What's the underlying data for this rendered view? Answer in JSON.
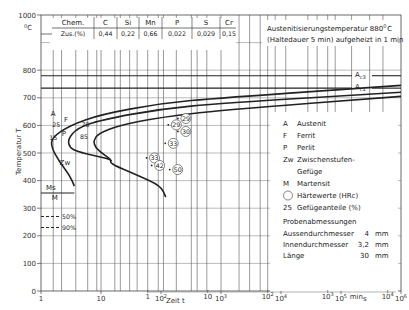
{
  "chart_data": {
    "type": "line",
    "ylabel": "Temperatur T",
    "yunit": "°C",
    "xlabel": "Zeit t",
    "xscale": "log",
    "xlim_s": [
      1,
      1000000
    ],
    "ylim": [
      0,
      1000
    ],
    "y_ticks": [
      "0",
      "100",
      "200",
      "300",
      "400",
      "500",
      "600",
      "700",
      "800",
      "1000"
    ],
    "x_ticks_s": [
      {
        "t": 1,
        "label": "1"
      },
      {
        "t": 10,
        "label": "10"
      },
      {
        "t": 100,
        "label": "10",
        "exp": "2"
      },
      {
        "t": 1000,
        "label": "10",
        "exp": "3"
      },
      {
        "t": 10000,
        "label": "10",
        "exp": "4"
      },
      {
        "t": 100000,
        "label": "10",
        "exp": "5"
      },
      {
        "t": 1000000,
        "label": "10",
        "exp": "6"
      }
    ],
    "x_unit_s": "s",
    "x_ticks_min": [
      {
        "t": 1,
        "label": "1"
      },
      {
        "t": 10,
        "label": "10"
      },
      {
        "t": 100,
        "label": "10",
        "exp": "2"
      },
      {
        "t": 1000,
        "label": "10",
        "exp": "3"
      },
      {
        "t": 10000,
        "label": "10",
        "exp": "4"
      }
    ],
    "x_unit_min": "min",
    "composition": {
      "header": [
        "Chem.",
        "C",
        "Si",
        "Mn",
        "P",
        "S",
        "Cr"
      ],
      "row": [
        "Zus.(%)",
        "0,44",
        "0,22",
        "0,66",
        "0,022",
        "0,029",
        "0,15"
      ]
    },
    "austenitization": {
      "line1": "Austenitisierungstemperatur 880",
      "deg": "0",
      "unit": "C",
      "line2": "(Haltedauer 5 min) aufgeheizt in 1 min"
    },
    "critical_temps": [
      {
        "name": "Ac3",
        "base": "A",
        "sub": "c3",
        "value": 780
      },
      {
        "name": "Ac1",
        "base": "A",
        "sub": "c1",
        "value": 735
      }
    ],
    "ms_line": {
      "label": "Ms",
      "value": 355
    },
    "martensite_lines": [
      {
        "label": "50%",
        "value": 270
      },
      {
        "label": "90%",
        "value": 230
      }
    ],
    "curves": [
      {
        "name": "ferrite-start",
        "points": [
          [
            1000000.0,
            745
          ],
          [
            1000,
            700
          ],
          [
            100,
            680
          ],
          [
            10,
            640
          ],
          [
            3,
            600
          ],
          [
            1.5,
            555
          ],
          [
            1.5,
            520
          ],
          [
            2,
            470
          ],
          [
            3,
            420
          ],
          [
            3.6,
            380
          ]
        ]
      },
      {
        "name": "pearlite-start",
        "points": [
          [
            1000000.0,
            720
          ],
          [
            1000,
            680
          ],
          [
            100,
            660
          ],
          [
            10,
            620
          ],
          [
            4,
            590
          ],
          [
            2.8,
            550
          ],
          [
            3,
            520
          ],
          [
            4,
            505
          ],
          [
            8,
            490
          ],
          [
            14,
            478
          ],
          [
            15,
            470
          ]
        ]
      },
      {
        "name": "pearlite-end",
        "points": [
          [
            1000000.0,
            705
          ],
          [
            1000,
            655
          ],
          [
            100,
            630
          ],
          [
            20,
            600
          ],
          [
            9,
            570
          ],
          [
            7.5,
            545
          ],
          [
            8,
            520
          ],
          [
            11,
            495
          ],
          [
            15,
            475
          ],
          [
            14,
            462
          ],
          [
            40,
            420
          ],
          [
            100,
            380
          ],
          [
            120,
            340
          ]
        ]
      }
    ],
    "region_labels": [
      {
        "key": "A",
        "t": 1.6,
        "T": 635
      },
      {
        "key": "F",
        "t": 2.6,
        "T": 612
      },
      {
        "key": "P",
        "t": 2.4,
        "T": 560
      },
      {
        "key": "Zw",
        "t": 2.5,
        "T": 455
      },
      {
        "key": "M",
        "t": 1.7,
        "T": 330
      }
    ],
    "fraction_labels": [
      {
        "value": "25",
        "t": 1.8,
        "T": 595
      },
      {
        "value": "15",
        "t": 1.6,
        "T": 548
      },
      {
        "value": "75",
        "t": 5.5,
        "T": 595
      },
      {
        "value": "85",
        "t": 5.2,
        "T": 550
      }
    ],
    "hardness_values": [
      {
        "value": "29",
        "t": 260,
        "T": 625
      },
      {
        "value": "29",
        "t": 180,
        "T": 602
      },
      {
        "value": "30",
        "t": 260,
        "T": 578
      },
      {
        "value": "33",
        "t": 160,
        "T": 535
      },
      {
        "value": "33",
        "t": 78,
        "T": 482
      },
      {
        "value": "42",
        "t": 95,
        "T": 455
      },
      {
        "value": "50",
        "t": 190,
        "T": 440
      }
    ],
    "legend": {
      "items": [
        {
          "key": "A",
          "text": "Austenit"
        },
        {
          "key": "F",
          "text": "Ferrit"
        },
        {
          "key": "P",
          "text": "Perlit"
        },
        {
          "key": "Zw",
          "text": "Zwischenstufen-"
        },
        {
          "key": "",
          "text": "Gefüge"
        },
        {
          "key": "M",
          "text": "Martensit"
        },
        {
          "key": "circle",
          "text": "Härtewerte (HRc)"
        },
        {
          "key": "25",
          "text": "Gefügeanteile (%)"
        }
      ],
      "placement": "right"
    },
    "specimen": {
      "title": "Probenabmessungen",
      "rows": [
        {
          "label": "Aussendurchmesser",
          "value": "4",
          "unit": "mm"
        },
        {
          "label": "Innendurchmesser",
          "value": "3,2",
          "unit": "mm"
        },
        {
          "label": "Länge",
          "value": "30",
          "unit": "mm"
        }
      ]
    },
    "cooling_curves_t_at_500": [
      1.6,
      2.2,
      3.8,
      6,
      8.5,
      10,
      17,
      21,
      30,
      40,
      60,
      90,
      110,
      180,
      320,
      400,
      580,
      1000,
      2000,
      3000,
      4500,
      6000,
      8000,
      12000,
      28000,
      40000,
      60000,
      80000,
      150000,
      300000,
      500000
    ]
  }
}
